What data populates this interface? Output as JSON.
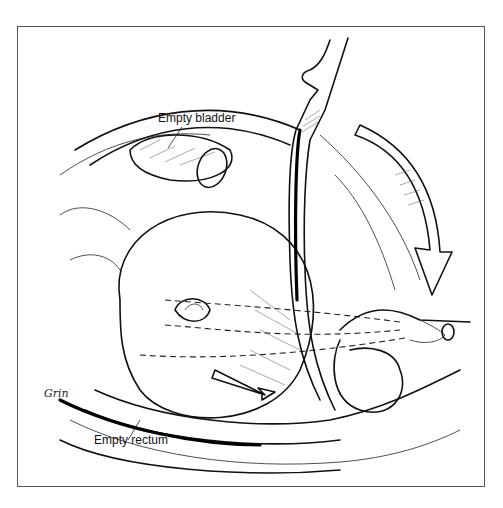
{
  "figure": {
    "type": "medical line illustration",
    "labels": {
      "bladder": "Empty bladder",
      "rectum": "Empty rectum"
    },
    "signature": "Grin",
    "colors": {
      "ink": "#111111",
      "background": "#ffffff",
      "frame": "#555555"
    }
  }
}
